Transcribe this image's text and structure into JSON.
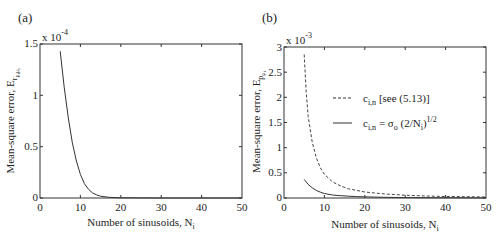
{
  "chart_data": [
    {
      "panel": "(a)",
      "type": "line",
      "title": "",
      "xlabel": "Number of sinusoids, N_i",
      "ylabel": "Mean-square error, E_{r_{μ_i μ_i}}",
      "y_scale_factor": "x 10^-4",
      "xlim": [
        0,
        50
      ],
      "ylim": [
        0,
        1.5
      ],
      "xticks": [
        0,
        10,
        20,
        30,
        40,
        50
      ],
      "yticks": [
        0,
        0.5,
        1,
        1.5
      ],
      "ytick_labels": [
        "0",
        "0.5",
        "1",
        "1.5"
      ],
      "grid": false,
      "legend": null,
      "series": [
        {
          "name": "E_r",
          "style": "solid",
          "x": [
            5,
            6,
            7,
            8,
            9,
            10,
            11,
            12,
            13,
            14,
            15,
            17,
            20,
            25,
            30,
            40,
            50
          ],
          "values": [
            1.43,
            1.08,
            0.78,
            0.54,
            0.36,
            0.23,
            0.14,
            0.085,
            0.05,
            0.03,
            0.018,
            0.007,
            0.002,
            0.0005,
            0.0002,
            0.0,
            0.0
          ]
        }
      ]
    },
    {
      "panel": "(b)",
      "type": "line",
      "title": "",
      "xlabel": "Number of sinusoids, N_i",
      "ylabel": "Mean-square error, E_{p_{μ_i}}",
      "y_scale_factor": "x 10^-3",
      "xlim": [
        0,
        50
      ],
      "ylim": [
        0,
        3
      ],
      "xticks": [
        0,
        10,
        20,
        30,
        40,
        50
      ],
      "yticks": [
        0,
        0.5,
        1,
        1.5,
        2,
        2.5,
        3
      ],
      "ytick_labels": [
        "0",
        "0.5",
        "1",
        "1.5",
        "2",
        "2.5",
        "3"
      ],
      "grid": false,
      "legend": {
        "position": "upper right (inside)",
        "entries": [
          {
            "label": "c_{i,n} [see (5.13)]",
            "style": "dashed"
          },
          {
            "label": "c_{i,n} = σ_o (2/N_i)^{1/2}",
            "style": "solid"
          }
        ]
      },
      "series": [
        {
          "name": "c_{i,n} [see (5.13)]",
          "style": "dashed",
          "x": [
            5,
            5.5,
            6,
            7,
            8,
            9,
            10,
            12,
            14,
            16,
            18,
            20,
            25,
            30,
            35,
            40,
            45,
            50
          ],
          "values": [
            2.85,
            2.1,
            1.62,
            1.1,
            0.8,
            0.6,
            0.47,
            0.32,
            0.24,
            0.18,
            0.15,
            0.12,
            0.08,
            0.055,
            0.04,
            0.03,
            0.025,
            0.02
          ]
        },
        {
          "name": "c_{i,n} = σ_o (2/N_i)^{1/2}",
          "style": "solid",
          "x": [
            5,
            6,
            7,
            8,
            9,
            10,
            12,
            14,
            16,
            18,
            20,
            25,
            30,
            40,
            50
          ],
          "values": [
            0.37,
            0.27,
            0.2,
            0.15,
            0.115,
            0.09,
            0.06,
            0.045,
            0.035,
            0.027,
            0.022,
            0.013,
            0.008,
            0.004,
            0.002
          ]
        }
      ]
    }
  ],
  "panels": {
    "a": {
      "label": "(a)",
      "scale": "x 10",
      "scale_exp": "-4",
      "ylabel_main": "Mean-square error, E",
      "ylabel_sub": "r",
      "ylabel_subsub": "μ",
      "ylabel_subsub2": "i",
      "ylabel_subsub3": "μ",
      "ylabel_subsub4": "i",
      "xlabel_main": "Number of sinusoids, N",
      "xlabel_sub": "i",
      "xticks": [
        "0",
        "10",
        "20",
        "30",
        "40",
        "50"
      ],
      "yticks": [
        "0",
        "0.5",
        "1",
        "1.5"
      ]
    },
    "b": {
      "label": "(b)",
      "scale": "x 10",
      "scale_exp": "-3",
      "ylabel_main": "Mean-square error, E",
      "ylabel_sub": "p",
      "ylabel_subsub": "μ",
      "ylabel_subsub2": "i",
      "xlabel_main": "Number of sinusoids, N",
      "xlabel_sub": "i",
      "xticks": [
        "0",
        "10",
        "20",
        "30",
        "40",
        "50"
      ],
      "yticks": [
        "0",
        "0.5",
        "1",
        "1.5",
        "2",
        "2.5",
        "3"
      ],
      "legend": {
        "dashed_main": "c",
        "dashed_sub": "i,n",
        "dashed_rest": " [see (5.13)]",
        "solid_main": "c",
        "solid_sub": "i,n",
        "solid_eq": " = σ",
        "solid_sigma_sub": "o",
        "solid_paren": " (2/N",
        "solid_N_sub": "i",
        "solid_close": ")",
        "solid_exp": "1/2"
      }
    }
  }
}
